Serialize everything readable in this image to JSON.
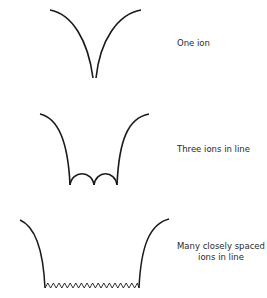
{
  "diagram": {
    "panels": [
      {
        "id": "one-ion",
        "label": "One ion",
        "ion_count": 1
      },
      {
        "id": "three-ions",
        "label": "Three ions in line",
        "ion_count": 3
      },
      {
        "id": "many-ions",
        "label_line1": "Many closely spaced",
        "label_line2": "ions in line",
        "ion_count": 17
      }
    ],
    "colors": {
      "stroke": "#1a1a1a",
      "text": "#2a2a2a",
      "background": "#ffffff"
    }
  }
}
